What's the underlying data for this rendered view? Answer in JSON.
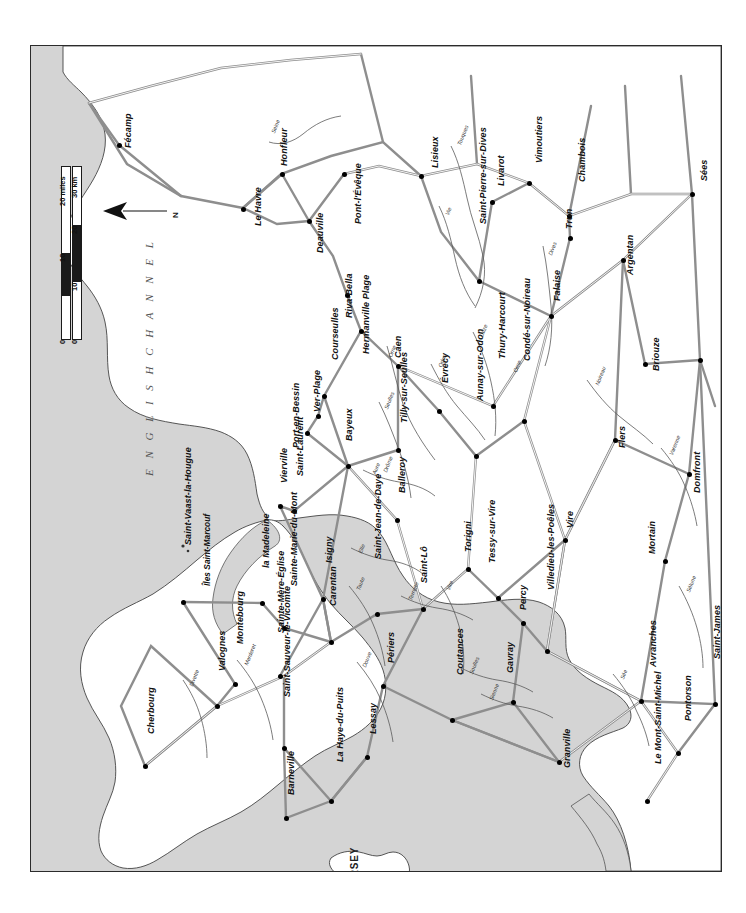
{
  "map": {
    "title": "Normandy 1944 region map",
    "orientation_note": "map printed rotated 90 degrees; labels read bottom-to-top",
    "sea_label": "E N G L I S H   C H A N N E L",
    "island_labels": [
      {
        "name": "JERSEY",
        "x": 318,
        "y": 845
      },
      {
        "name": "Îles Saint-Marcouf",
        "x": 171,
        "y": 540
      }
    ],
    "colors": {
      "sea": "#d4d4d4",
      "land": "#ffffff",
      "frame": "#2b2b2b",
      "road": "#8a8a8a",
      "river": "#555555",
      "text": "#111111"
    },
    "scale": {
      "miles_label": "20 miles",
      "km_label": "30 km",
      "miles_ticks": [
        "0",
        "10",
        "20"
      ],
      "km_ticks": [
        "0",
        "10",
        "20",
        "30"
      ]
    },
    "north_arrow": {
      "label": "N"
    },
    "towns": [
      {
        "name": "Fécamp",
        "lx": 92,
        "ly": 102,
        "dx": 88,
        "dy": 99
      },
      {
        "name": "Le Havre",
        "lx": 222,
        "ly": 180,
        "dx": 212,
        "dy": 163
      },
      {
        "name": "Honfleur",
        "lx": 248,
        "ly": 120,
        "dx": 251,
        "dy": 128
      },
      {
        "name": "Deauville",
        "lx": 284,
        "ly": 207,
        "dx": 278,
        "dy": 175
      },
      {
        "name": "Pont-l'Évêque",
        "lx": 322,
        "ly": 178,
        "dx": 313,
        "dy": 128
      },
      {
        "name": "Lisieux",
        "lx": 399,
        "ly": 122,
        "dx": 390,
        "dy": 130
      },
      {
        "name": "Saint-Pierre-sur-Dives",
        "lx": 447,
        "ly": 178,
        "dx": 448,
        "dy": 235
      },
      {
        "name": "Livarot",
        "lx": 465,
        "ly": 140,
        "dx": 461,
        "dy": 156
      },
      {
        "name": "Vimoutiers",
        "lx": 503,
        "ly": 117,
        "dx": 498,
        "dy": 137
      },
      {
        "name": "Chambois",
        "lx": 546,
        "ly": 136,
        "dx": 538,
        "dy": 170
      },
      {
        "name": "Trun",
        "lx": 533,
        "ly": 183,
        "dx": 539,
        "dy": 192
      },
      {
        "name": "Sées",
        "lx": 668,
        "ly": 135,
        "dx": 661,
        "dy": 148
      },
      {
        "name": "Argentan",
        "lx": 594,
        "ly": 229,
        "dx": 592,
        "dy": 214
      },
      {
        "name": "Falaise",
        "lx": 521,
        "ly": 255,
        "dx": 520,
        "dy": 270
      },
      {
        "name": "La Ferté-Macé",
        "lx": 691,
        "ly": 281,
        "dx": 669,
        "dy": 314
      },
      {
        "name": "Briouze",
        "lx": 620,
        "ly": 325,
        "dx": 614,
        "dy": 318
      },
      {
        "name": "Riva-Bella",
        "lx": 313,
        "ly": 272,
        "dx": 316,
        "dy": 249
      },
      {
        "name": "Caen",
        "lx": 362,
        "ly": 312,
        "dx": 367,
        "dy": 320
      },
      {
        "name": "Courseulles",
        "lx": 299,
        "ly": 314,
        "dx": 293,
        "dy": 350
      },
      {
        "name": "Hermanville Plage",
        "lx": 330,
        "ly": 308,
        "dx": 330,
        "dy": 285
      },
      {
        "name": "Ver-Plage",
        "lx": 281,
        "ly": 366,
        "dx": 287,
        "dy": 370
      },
      {
        "name": "Port-en-Bessin",
        "lx": 260,
        "ly": 402,
        "dx": 276,
        "dy": 387
      },
      {
        "name": "Bayeux",
        "lx": 313,
        "ly": 395,
        "dx": 317,
        "dy": 420
      },
      {
        "name": "Tilly-sur-Seulles",
        "lx": 368,
        "ly": 377,
        "dx": 367,
        "dy": 404
      },
      {
        "name": "Évrecy",
        "lx": 409,
        "ly": 337,
        "dx": 408,
        "dy": 365
      },
      {
        "name": "Aunay-sur-Odon",
        "lx": 444,
        "ly": 355,
        "dx": 445,
        "dy": 410
      },
      {
        "name": "Thury-Harcourt",
        "lx": 466,
        "ly": 313,
        "dx": 462,
        "dy": 360
      },
      {
        "name": "Condé-sur-Noireau",
        "lx": 491,
        "ly": 315,
        "dx": 493,
        "dy": 375
      },
      {
        "name": "Flers",
        "lx": 586,
        "ly": 402,
        "dx": 584,
        "dy": 394
      },
      {
        "name": "Domfront",
        "lx": 661,
        "ly": 447,
        "dx": 658,
        "dy": 428
      },
      {
        "name": "Vire",
        "lx": 534,
        "ly": 482,
        "dx": 534,
        "dy": 494
      },
      {
        "name": "Mortain",
        "lx": 616,
        "ly": 508,
        "dx": 634,
        "dy": 515
      },
      {
        "name": "Villedieu-les-Poêles",
        "lx": 515,
        "ly": 544,
        "dx": 516,
        "dy": 605
      },
      {
        "name": "Avranches",
        "lx": 617,
        "ly": 621,
        "dx": 610,
        "dy": 655
      },
      {
        "name": "Saint-James",
        "lx": 681,
        "ly": 613,
        "dx": 684,
        "dy": 658
      },
      {
        "name": "Pontorson",
        "lx": 652,
        "ly": 675,
        "dx": 647,
        "dy": 707
      },
      {
        "name": "Le Mont-Saint-Michel",
        "lx": 622,
        "ly": 718,
        "dx": 616,
        "dy": 755
      },
      {
        "name": "Granville",
        "lx": 531,
        "ly": 722,
        "dx": 528,
        "dy": 716
      },
      {
        "name": "Gavray",
        "lx": 474,
        "ly": 627,
        "dx": 482,
        "dy": 656
      },
      {
        "name": "Coutances",
        "lx": 424,
        "ly": 629,
        "dx": 421,
        "dy": 674
      },
      {
        "name": "Percy",
        "lx": 487,
        "ly": 564,
        "dx": 492,
        "dy": 577
      },
      {
        "name": "Tessy-sur-Vire",
        "lx": 456,
        "ly": 517,
        "dx": 467,
        "dy": 552
      },
      {
        "name": "Torigni",
        "lx": 432,
        "ly": 506,
        "dx": 437,
        "dy": 523
      },
      {
        "name": "Saint-Lô",
        "lx": 388,
        "ly": 537,
        "dx": 392,
        "dy": 563
      },
      {
        "name": "Saint-Jean-de-Daye",
        "lx": 342,
        "ly": 513,
        "dx": 346,
        "dy": 568
      },
      {
        "name": "Balleroy",
        "lx": 366,
        "ly": 447,
        "dx": 366,
        "dy": 474
      },
      {
        "name": "Isigny",
        "lx": 293,
        "ly": 517,
        "dx": 292,
        "dy": 553
      },
      {
        "name": "Carentan",
        "lx": 297,
        "ly": 560,
        "dx": 300,
        "dy": 596
      },
      {
        "name": "Périers",
        "lx": 355,
        "ly": 617,
        "dx": 352,
        "dy": 640
      },
      {
        "name": "Lessay",
        "lx": 337,
        "ly": 688,
        "dx": 336,
        "dy": 711
      },
      {
        "name": "Saint-Laurent",
        "lx": 264,
        "ly": 430,
        "dx": 263,
        "dy": 465
      },
      {
        "name": "Vierville",
        "lx": 248,
        "ly": 437,
        "dx": 249,
        "dy": 460
      },
      {
        "name": "la Madeleine",
        "lx": 230,
        "ly": 522,
        "dx": 231,
        "dy": 557
      },
      {
        "name": "Sainte-Marie-du-Mont",
        "lx": 258,
        "ly": 540,
        "dx": 253,
        "dy": 582
      },
      {
        "name": "Sainte-Mère-Église",
        "lx": 245,
        "ly": 587,
        "dx": 249,
        "dy": 630
      },
      {
        "name": "Saint-Sauveur-le-Vicomte",
        "lx": 251,
        "ly": 651,
        "dx": 253,
        "dy": 702
      },
      {
        "name": "La Haye-du-Puits",
        "lx": 304,
        "ly": 716,
        "dx": 300,
        "dy": 755
      },
      {
        "name": "Barneville",
        "lx": 255,
        "ly": 749,
        "dx": 255,
        "dy": 772
      },
      {
        "name": "Montebourg",
        "lx": 204,
        "ly": 598,
        "dx": 204,
        "dy": 638
      },
      {
        "name": "Valognes",
        "lx": 186,
        "ly": 625,
        "dx": 186,
        "dy": 660
      },
      {
        "name": "Cherbourg",
        "lx": 115,
        "ly": 688,
        "dx": 114,
        "dy": 720
      },
      {
        "name": "Saint-Vaast-la-Hougue",
        "lx": 152,
        "ly": 499,
        "dx": 152,
        "dy": 556
      }
    ],
    "rivers": [
      {
        "name": "Seine",
        "lx": 239,
        "ly": 86
      },
      {
        "name": "Touques",
        "lx": 425,
        "ly": 98
      },
      {
        "name": "Vie",
        "lx": 413,
        "ly": 168
      },
      {
        "name": "Dives",
        "lx": 516,
        "ly": 208
      },
      {
        "name": "Orne",
        "lx": 356,
        "ly": 310
      },
      {
        "name": "Odon",
        "lx": 406,
        "ly": 320
      },
      {
        "name": "Laize",
        "lx": 447,
        "ly": 290
      },
      {
        "name": "Noireau",
        "lx": 563,
        "ly": 338
      },
      {
        "name": "Seulles",
        "lx": 352,
        "ly": 362
      },
      {
        "name": "Aure",
        "lx": 340,
        "ly": 427
      },
      {
        "name": "Drôme",
        "lx": 351,
        "ly": 425
      },
      {
        "name": "Vire",
        "lx": 414,
        "ly": 543
      },
      {
        "name": "Elle",
        "lx": 326,
        "ly": 506
      },
      {
        "name": "Taute",
        "lx": 324,
        "ly": 543
      },
      {
        "name": "Terrette",
        "lx": 376,
        "ly": 553
      },
      {
        "name": "Douve",
        "lx": 330,
        "ly": 620
      },
      {
        "name": "Merderet",
        "lx": 212,
        "ly": 618
      },
      {
        "name": "Divette",
        "lx": 157,
        "ly": 639
      },
      {
        "name": "Soulles",
        "lx": 437,
        "ly": 627
      },
      {
        "name": "Sienne",
        "lx": 457,
        "ly": 653
      },
      {
        "name": "Sée",
        "lx": 588,
        "ly": 632
      },
      {
        "name": "Sélune",
        "lx": 654,
        "ly": 545
      },
      {
        "name": "Varenne",
        "lx": 637,
        "ly": 408
      },
      {
        "name": "Orne",
        "lx": 481,
        "ly": 325
      }
    ]
  }
}
